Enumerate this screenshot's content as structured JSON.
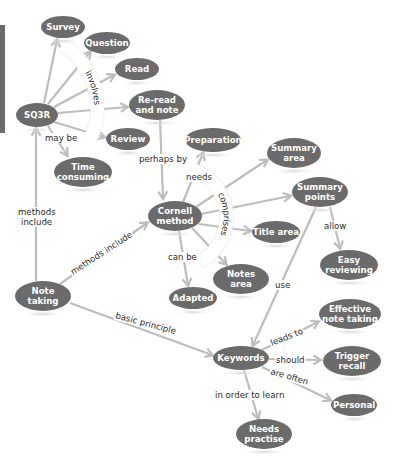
{
  "diagram": {
    "type": "concept-map",
    "colors": {
      "node_fill": "#6b6b6b",
      "node_text": "#ffffff",
      "edge": "#bdbdbd",
      "label_text": "#2a2a2a",
      "sidebar_bar": "#6b6b6b"
    },
    "nodes": [
      {
        "id": "survey",
        "lines": [
          "Survey"
        ],
        "cx": 63,
        "cy": 27,
        "rx": 22,
        "ry": 11
      },
      {
        "id": "question",
        "lines": [
          "Question"
        ],
        "cx": 107,
        "cy": 43,
        "rx": 23,
        "ry": 11
      },
      {
        "id": "read",
        "lines": [
          "Read"
        ],
        "cx": 137,
        "cy": 69,
        "rx": 22,
        "ry": 11
      },
      {
        "id": "reread",
        "lines": [
          "Re-read",
          "and note"
        ],
        "cx": 157,
        "cy": 105,
        "rx": 28,
        "ry": 15
      },
      {
        "id": "sq3r",
        "lines": [
          "SQ3R"
        ],
        "cx": 37,
        "cy": 115,
        "rx": 21,
        "ry": 12
      },
      {
        "id": "review",
        "lines": [
          "Review"
        ],
        "cx": 128,
        "cy": 139,
        "rx": 22,
        "ry": 11
      },
      {
        "id": "time",
        "lines": [
          "Time",
          "consuming"
        ],
        "cx": 83,
        "cy": 172,
        "rx": 29,
        "ry": 15
      },
      {
        "id": "preparation",
        "lines": [
          "Preparation"
        ],
        "cx": 213,
        "cy": 140,
        "rx": 28,
        "ry": 12
      },
      {
        "id": "summaryarea",
        "lines": [
          "Summary",
          "area"
        ],
        "cx": 294,
        "cy": 153,
        "rx": 27,
        "ry": 15
      },
      {
        "id": "summarypoints",
        "lines": [
          "Summary",
          "points"
        ],
        "cx": 320,
        "cy": 192,
        "rx": 28,
        "ry": 15
      },
      {
        "id": "cornell",
        "lines": [
          "Cornell",
          "method"
        ],
        "cx": 175,
        "cy": 216,
        "rx": 27,
        "ry": 15
      },
      {
        "id": "titlearea",
        "lines": [
          "Title area"
        ],
        "cx": 276,
        "cy": 232,
        "rx": 24,
        "ry": 11
      },
      {
        "id": "notesarea",
        "lines": [
          "Notes",
          "area"
        ],
        "cx": 241,
        "cy": 279,
        "rx": 28,
        "ry": 15
      },
      {
        "id": "easy",
        "lines": [
          "Easy",
          "reviewing"
        ],
        "cx": 349,
        "cy": 265,
        "rx": 29,
        "ry": 15
      },
      {
        "id": "notetaking",
        "lines": [
          "Note",
          "taking"
        ],
        "cx": 43,
        "cy": 296,
        "rx": 28,
        "ry": 15
      },
      {
        "id": "adapted",
        "lines": [
          "Adapted"
        ],
        "cx": 193,
        "cy": 298,
        "rx": 24,
        "ry": 11
      },
      {
        "id": "effective",
        "lines": [
          "Effective",
          "note taking"
        ],
        "cx": 350,
        "cy": 314,
        "rx": 31,
        "ry": 15
      },
      {
        "id": "keywords",
        "lines": [
          "Keywords"
        ],
        "cx": 241,
        "cy": 358,
        "rx": 28,
        "ry": 12
      },
      {
        "id": "trigger",
        "lines": [
          "Trigger",
          "recall"
        ],
        "cx": 352,
        "cy": 361,
        "rx": 29,
        "ry": 15
      },
      {
        "id": "personal",
        "lines": [
          "Personal"
        ],
        "cx": 354,
        "cy": 405,
        "rx": 23,
        "ry": 11
      },
      {
        "id": "practise",
        "lines": [
          "Needs",
          "practise"
        ],
        "cx": 264,
        "cy": 434,
        "rx": 28,
        "ry": 15
      }
    ],
    "edges": [
      {
        "from": "sq3r",
        "to": "survey",
        "x1": 44,
        "y1": 103,
        "x2": 57,
        "y2": 40
      },
      {
        "from": "sq3r",
        "to": "question",
        "x1": 48,
        "y1": 104,
        "x2": 90,
        "y2": 52
      },
      {
        "from": "sq3r",
        "to": "read",
        "x1": 54,
        "y1": 107,
        "x2": 114,
        "y2": 75
      },
      {
        "from": "sq3r",
        "to": "reread",
        "x1": 58,
        "y1": 113,
        "x2": 127,
        "y2": 107
      },
      {
        "from": "sq3r",
        "to": "review",
        "x1": 54,
        "y1": 122,
        "x2": 104,
        "y2": 137
      },
      {
        "from": "sq3r",
        "to": "time",
        "x1": 48,
        "y1": 126,
        "x2": 67,
        "y2": 155
      },
      {
        "from": "reread",
        "to": "cornell",
        "x1": 160,
        "y1": 120,
        "x2": 163,
        "y2": 198
      },
      {
        "from": "cornell",
        "to": "preparation",
        "x1": 183,
        "y1": 202,
        "x2": 203,
        "y2": 153
      },
      {
        "from": "cornell",
        "to": "summaryarea",
        "x1": 196,
        "y1": 207,
        "x2": 267,
        "y2": 160
      },
      {
        "from": "cornell",
        "to": "summarypoints",
        "x1": 201,
        "y1": 214,
        "x2": 290,
        "y2": 196
      },
      {
        "from": "cornell",
        "to": "titlearea",
        "x1": 199,
        "y1": 224,
        "x2": 250,
        "y2": 231
      },
      {
        "from": "cornell",
        "to": "notesarea",
        "x1": 192,
        "y1": 228,
        "x2": 226,
        "y2": 264
      },
      {
        "from": "cornell",
        "to": "adapted",
        "x1": 179,
        "y1": 231,
        "x2": 188,
        "y2": 285
      },
      {
        "from": "summarypoints",
        "to": "easy",
        "x1": 330,
        "y1": 207,
        "x2": 340,
        "y2": 248
      },
      {
        "from": "summarypoints",
        "to": "keywords",
        "x1": 316,
        "y1": 207,
        "x2": 253,
        "y2": 345
      },
      {
        "from": "notetaking",
        "to": "sq3r",
        "x1": 36,
        "y1": 281,
        "x2": 36,
        "y2": 129
      },
      {
        "from": "notetaking",
        "to": "cornell",
        "x1": 60,
        "y1": 284,
        "x2": 147,
        "y2": 223
      },
      {
        "from": "notetaking",
        "to": "keywords",
        "x1": 70,
        "y1": 303,
        "x2": 212,
        "y2": 355
      },
      {
        "from": "keywords",
        "to": "effective",
        "x1": 262,
        "y1": 350,
        "x2": 318,
        "y2": 322
      },
      {
        "from": "keywords",
        "to": "trigger",
        "x1": 269,
        "y1": 359,
        "x2": 320,
        "y2": 360
      },
      {
        "from": "keywords",
        "to": "personal",
        "x1": 262,
        "y1": 367,
        "x2": 330,
        "y2": 400
      },
      {
        "from": "keywords",
        "to": "practise",
        "x1": 244,
        "y1": 370,
        "x2": 258,
        "y2": 418
      }
    ],
    "arc_labels": [
      {
        "id": "involves",
        "text": "involves",
        "path": "M 63 45 A 75 75 0 0 1 90 140"
      },
      {
        "id": "comprises",
        "text": "comprises",
        "path": "M 193 170 A 50 50 0 0 1 199 262"
      }
    ],
    "edge_labels": [
      {
        "id": "may-be",
        "text": "may be",
        "x": 45,
        "y": 141,
        "rotate": 0
      },
      {
        "id": "perhaps-by",
        "text": "perhaps by",
        "x": 139,
        "y": 162,
        "rotate": 0
      },
      {
        "id": "needs",
        "text": "needs",
        "x": 186,
        "y": 180,
        "rotate": 0
      },
      {
        "id": "can-be",
        "text": "can be",
        "x": 168,
        "y": 260,
        "rotate": 0
      },
      {
        "id": "methods-include-1",
        "text": "methods",
        "x": 18,
        "y": 215,
        "rotate": 0
      },
      {
        "id": "methods-include-2",
        "text": "include",
        "x": 21,
        "y": 225,
        "rotate": 0
      },
      {
        "id": "methods-include-diag",
        "text": "methods include",
        "x": 73,
        "y": 275,
        "rotate": -33
      },
      {
        "id": "allow",
        "text": "allow",
        "x": 324,
        "y": 229,
        "rotate": 0
      },
      {
        "id": "use",
        "text": "use",
        "x": 275,
        "y": 288,
        "rotate": 0
      },
      {
        "id": "basic-principle",
        "text": "basic principle",
        "x": 115,
        "y": 318,
        "rotate": 15
      },
      {
        "id": "leads-to",
        "text": "leads to",
        "x": 272,
        "y": 346,
        "rotate": -22
      },
      {
        "id": "should",
        "text": "should",
        "x": 276,
        "y": 363,
        "rotate": 0
      },
      {
        "id": "are-often",
        "text": "are often",
        "x": 270,
        "y": 374,
        "rotate": 16
      },
      {
        "id": "in-order-to-learn",
        "text": "in order to learn",
        "x": 215,
        "y": 398,
        "rotate": 0
      }
    ]
  }
}
